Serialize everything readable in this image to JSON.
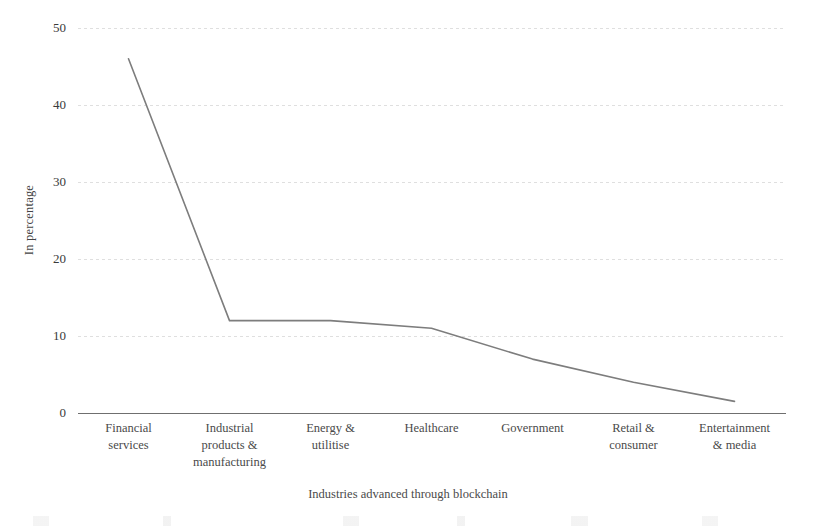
{
  "chart_data": {
    "type": "line",
    "title": "",
    "xlabel": "Industries advanced through blockchain",
    "ylabel": "In percentage",
    "categories": [
      "Financial services",
      "Industrial products & manufacturing",
      "Energy & utilitise",
      "Healthcare",
      "Government",
      "Retail & consumer",
      "Entertainment & media"
    ],
    "category_lines": [
      [
        "Financial",
        "services"
      ],
      [
        "Industrial",
        "products &",
        "manufacturing"
      ],
      [
        "Energy &",
        "utilitise"
      ],
      [
        "Healthcare"
      ],
      [
        "Government"
      ],
      [
        "Retail &",
        "consumer"
      ],
      [
        "Entertainment",
        "& media"
      ]
    ],
    "values": [
      46,
      12,
      12,
      11,
      7,
      4,
      1.5
    ],
    "ylim": [
      0,
      50
    ],
    "yticks": [
      0,
      10,
      20,
      30,
      40,
      50
    ],
    "ytick_labels": [
      "0",
      "10",
      "20",
      "30",
      "40",
      "50"
    ],
    "grid": true,
    "legend": "none",
    "series_color": "#7d7d7d",
    "grid_color": "#dfdfdf",
    "axis_color": "#6f6f6f"
  }
}
